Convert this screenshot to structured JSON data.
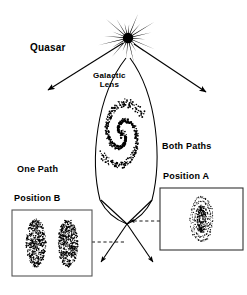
{
  "figure": {
    "background_color": "#ffffff",
    "ink_color": "#000000",
    "width": 247,
    "height": 295
  },
  "labels": {
    "quasar": "Quasar",
    "galactic_lens_line1": "Galactic",
    "galactic_lens_line2": "Lens",
    "both_paths": "Both Paths",
    "one_path": "One Path",
    "position_a": "Position A",
    "position_b": "Position B"
  },
  "elements": {
    "quasar_source": {
      "name": "quasar-starburst",
      "center_x": 128,
      "center_y": 38,
      "spike_count": 20,
      "outer_radius": 30,
      "color": "#000000"
    },
    "galactic_lens": {
      "name": "lens-envelope",
      "shape": "vesica",
      "top_y": 62,
      "bottom_y": 216,
      "center_x": 123,
      "half_width": 33,
      "color": "#000000"
    },
    "spiral_galaxy": {
      "name": "stippled-spiral-galaxy",
      "center_x": 122,
      "center_y": 134,
      "arm_count": 2,
      "stipple": true,
      "color": "#000000"
    },
    "light_paths": {
      "name": "lensed-ray-paths",
      "crossing_point_x": 127,
      "crossing_point_y": 222,
      "description": "Two rays from the quasar bend around the lens and cross below it"
    },
    "escaping_rays": {
      "name": "unlensed-rays",
      "count": 2,
      "description": "Straight arrows from the quasar escaping to lower-left and lower-right"
    },
    "dashed_connectors": [
      {
        "name": "dashed-connector-to-position-a",
        "y": 221,
        "from_x": 127,
        "to_x": 160,
        "direction": "left-arrow"
      },
      {
        "name": "dashed-connector-to-position-b",
        "y": 242,
        "from_x": 127,
        "to_x": 93,
        "direction": "left"
      }
    ]
  },
  "panels": [
    {
      "id": "position-b",
      "name": "position-b-panel",
      "heading_label": "One Path",
      "title": "Position B",
      "x": 12,
      "y": 210,
      "width": 80,
      "height": 66,
      "border_color": "#555555",
      "image_count": 2,
      "image_description": "Two separate stippled elongated blobs (double image)"
    },
    {
      "id": "position-a",
      "name": "position-a-panel",
      "heading_label": "Both Paths",
      "title": "Position A",
      "x": 160,
      "y": 188,
      "width": 83,
      "height": 62,
      "border_color": "#333333",
      "image_count": 1,
      "image_description": "Single stippled elongated blob with concentric rings"
    }
  ]
}
